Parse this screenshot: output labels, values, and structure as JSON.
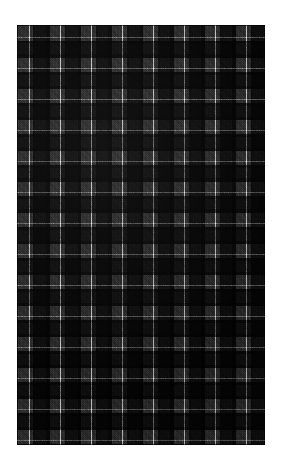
{
  "page": {
    "background_color": "#ffffff",
    "width": 282,
    "height": 468
  },
  "swatch": {
    "name": "tartan-fabric-swatch",
    "description": "Dark grey and black tartan plaid fabric swatch",
    "x": 17,
    "y": 25,
    "width": 248,
    "height": 420,
    "sett_repeat_px": 31,
    "repeats_horizontal": 8,
    "repeats_vertical": 13.5,
    "weave": "twill",
    "symmetric": true,
    "palette": {
      "black_block": "#111111",
      "dark_separator": "#080808",
      "mid_grey_block": "#3a3a3a",
      "white_pinstripe": "#d8d8d8",
      "ground": "#0a0a0a"
    },
    "thread_count": [
      {
        "color_name": "dark_separator",
        "color": "#080808",
        "width_px": 1.5,
        "order": 1
      },
      {
        "color_name": "mid_grey_block",
        "color": "#3a3a3a",
        "width_px": 10.5,
        "order": 2
      },
      {
        "color_name": "white_pinstripe",
        "color": "#d8d8d8",
        "width_px": 1.0,
        "order": 3
      },
      {
        "color_name": "mid_grey_block",
        "color": "#3a3a3a",
        "width_px": 3.5,
        "order": 4
      },
      {
        "color_name": "dark_separator",
        "color": "#0d0d0d",
        "width_px": 2.0,
        "order": 5
      },
      {
        "color_name": "black_block",
        "color": "#111111",
        "width_px": 11.0,
        "order": 6
      },
      {
        "color_name": "dark_separator",
        "color": "#080808",
        "width_px": 1.5,
        "order": 7
      }
    ]
  }
}
